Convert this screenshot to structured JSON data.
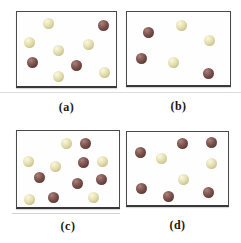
{
  "figure": {
    "type": "particulate-diagram",
    "panels": [
      {
        "id": "a",
        "label": "(a)",
        "counts": {
          "light": 6,
          "dark": 3,
          "total": 9
        },
        "spheres": [
          {
            "type": "light",
            "x": 31,
            "y": 11
          },
          {
            "type": "dark",
            "x": 86,
            "y": 13
          },
          {
            "type": "light",
            "x": 12,
            "y": 30
          },
          {
            "type": "light",
            "x": 71,
            "y": 32
          },
          {
            "type": "light",
            "x": 41,
            "y": 38
          },
          {
            "type": "dark",
            "x": 15,
            "y": 50
          },
          {
            "type": "dark",
            "x": 59,
            "y": 53
          },
          {
            "type": "light",
            "x": 41,
            "y": 64
          },
          {
            "type": "light",
            "x": 87,
            "y": 60
          }
        ]
      },
      {
        "id": "b",
        "label": "(b)",
        "counts": {
          "light": 3,
          "dark": 3,
          "total": 6
        },
        "spheres": [
          {
            "type": "light",
            "x": 54,
            "y": 13
          },
          {
            "type": "dark",
            "x": 21,
            "y": 20
          },
          {
            "type": "light",
            "x": 82,
            "y": 28
          },
          {
            "type": "dark",
            "x": 14,
            "y": 46
          },
          {
            "type": "light",
            "x": 46,
            "y": 50
          },
          {
            "type": "dark",
            "x": 81,
            "y": 61
          }
        ]
      },
      {
        "id": "c",
        "label": "(c)",
        "counts": {
          "light": 6,
          "dark": 6,
          "total": 12
        },
        "spheres": [
          {
            "type": "light",
            "x": 49,
            "y": 12
          },
          {
            "type": "dark",
            "x": 68,
            "y": 12
          },
          {
            "type": "light",
            "x": 11,
            "y": 30
          },
          {
            "type": "dark",
            "x": 66,
            "y": 31
          },
          {
            "type": "light",
            "x": 85,
            "y": 30
          },
          {
            "type": "light",
            "x": 38,
            "y": 35
          },
          {
            "type": "dark",
            "x": 22,
            "y": 46
          },
          {
            "type": "dark",
            "x": 84,
            "y": 48
          },
          {
            "type": "dark",
            "x": 60,
            "y": 52
          },
          {
            "type": "light",
            "x": 12,
            "y": 68
          },
          {
            "type": "dark",
            "x": 36,
            "y": 66
          },
          {
            "type": "light",
            "x": 76,
            "y": 66
          }
        ]
      },
      {
        "id": "d",
        "label": "(d)",
        "counts": {
          "light": 3,
          "dark": 6,
          "total": 9
        },
        "spheres": [
          {
            "type": "dark",
            "x": 55,
            "y": 11
          },
          {
            "type": "dark",
            "x": 84,
            "y": 10
          },
          {
            "type": "dark",
            "x": 13,
            "y": 20
          },
          {
            "type": "light",
            "x": 34,
            "y": 26
          },
          {
            "type": "light",
            "x": 84,
            "y": 31
          },
          {
            "type": "light",
            "x": 56,
            "y": 47
          },
          {
            "type": "dark",
            "x": 14,
            "y": 56
          },
          {
            "type": "dark",
            "x": 81,
            "y": 60
          },
          {
            "type": "dark",
            "x": 41,
            "y": 64
          }
        ]
      }
    ]
  },
  "palette": {
    "background": "#ffffff",
    "box_border": "#4a4a4a",
    "label_color": "#1e150d",
    "light_sphere_base": "#ddd7a4",
    "light_sphere_highlight": "#faf7e2",
    "light_sphere_shadow": "#a9a272",
    "dark_sphere_base": "#714a45",
    "dark_sphere_highlight": "#a8847c",
    "dark_sphere_shadow": "#432824",
    "artifact_line": "#dcdcdc"
  }
}
